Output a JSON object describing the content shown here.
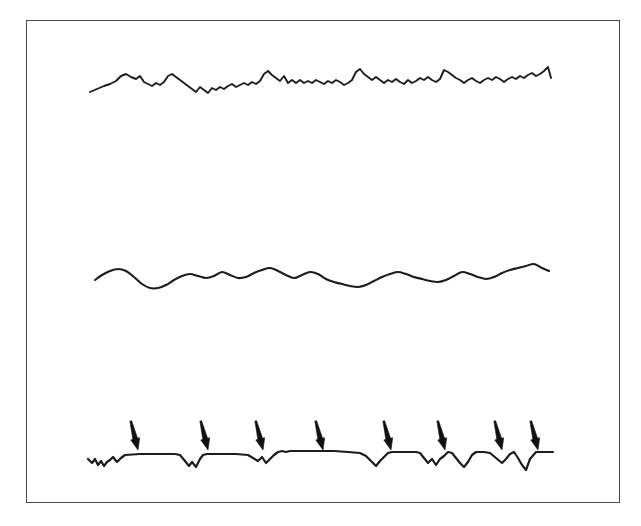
{
  "figure": {
    "title": "",
    "caption": "",
    "background_color": "#ffffff",
    "frame_color": "#4a4a4a",
    "trace_color": "#1c1c1c",
    "arrow_color": "#101010",
    "frame": {
      "x": 26,
      "y": 20,
      "width": 594,
      "height": 483
    }
  },
  "chart_data": {
    "type": "line",
    "title": "",
    "subtitle": "",
    "xlabel": "",
    "ylabel": "",
    "grid": false,
    "legend_position": "none",
    "xlim": [
      90,
      553
    ],
    "ylim": [
      20,
      503
    ],
    "series": [
      {
        "name": "top-noisy-trace",
        "style": "jagged high-frequency noise",
        "stroke_width": 1.9,
        "baseline_y": 88,
        "x": [
          90,
          97,
          104,
          110,
          116,
          121,
          126,
          131,
          136,
          140,
          144,
          148,
          152,
          156,
          160,
          164,
          168,
          172,
          176,
          180,
          184,
          188,
          192,
          196,
          200,
          204,
          208,
          212,
          216,
          220,
          224,
          228,
          232,
          236,
          240,
          244,
          248,
          252,
          256,
          260,
          264,
          268,
          272,
          276,
          280,
          284,
          288,
          292,
          296,
          300,
          304,
          308,
          312,
          316,
          320,
          324,
          328,
          332,
          336,
          340,
          344,
          348,
          352,
          356,
          360,
          364,
          368,
          372,
          376,
          380,
          384,
          388,
          392,
          396,
          400,
          404,
          408,
          412,
          416,
          420,
          424,
          428,
          432,
          436,
          440,
          444,
          448,
          452,
          456,
          460,
          464,
          468,
          472,
          476,
          480,
          484,
          488,
          492,
          496,
          500,
          504,
          508,
          512,
          516,
          520,
          524,
          528,
          532,
          536,
          540,
          544,
          548,
          551
        ],
        "y": [
          92,
          89,
          86,
          84,
          81,
          76,
          74,
          77,
          79,
          76,
          82,
          84,
          86,
          83,
          85,
          82,
          76,
          74,
          77,
          80,
          83,
          86,
          89,
          92,
          87,
          90,
          93,
          88,
          90,
          87,
          89,
          86,
          84,
          87,
          85,
          83,
          85,
          82,
          84,
          81,
          74,
          71,
          75,
          78,
          81,
          76,
          83,
          80,
          83,
          80,
          83,
          81,
          83,
          80,
          82,
          84,
          81,
          83,
          80,
          82,
          85,
          83,
          80,
          72,
          69,
          74,
          77,
          80,
          77,
          80,
          83,
          80,
          82,
          79,
          82,
          84,
          80,
          83,
          81,
          78,
          80,
          77,
          80,
          82,
          79,
          70,
          72,
          75,
          78,
          80,
          83,
          80,
          78,
          81,
          83,
          80,
          78,
          80,
          77,
          79,
          82,
          79,
          77,
          79,
          76,
          78,
          75,
          73,
          76,
          74,
          71,
          67,
          78
        ]
      },
      {
        "name": "middle-smooth-trace",
        "style": "smooth low-frequency wave",
        "stroke_width": 2.1,
        "baseline_y": 280,
        "x": [
          95,
          102,
          110,
          118,
          126,
          134,
          142,
          150,
          158,
          166,
          174,
          182,
          190,
          198,
          206,
          214,
          222,
          230,
          238,
          246,
          254,
          262,
          270,
          278,
          286,
          294,
          302,
          310,
          318,
          326,
          334,
          342,
          350,
          358,
          366,
          374,
          382,
          390,
          398,
          406,
          414,
          422,
          430,
          438,
          446,
          454,
          462,
          470,
          478,
          486,
          494,
          502,
          510,
          518,
          526,
          534,
          542,
          549
        ],
        "y": [
          280,
          275,
          271,
          269,
          271,
          277,
          284,
          288,
          288,
          285,
          280,
          276,
          274,
          276,
          278,
          276,
          272,
          275,
          278,
          277,
          273,
          270,
          268,
          271,
          275,
          278,
          275,
          272,
          274,
          279,
          282,
          284,
          286,
          287,
          285,
          281,
          277,
          274,
          272,
          274,
          277,
          279,
          281,
          282,
          280,
          276,
          272,
          274,
          277,
          279,
          277,
          273,
          270,
          268,
          266,
          264,
          268,
          271
        ]
      },
      {
        "name": "bottom-step-trace",
        "style": "step-like trace with downward deflections",
        "stroke_width": 2.2,
        "baseline_y": 458,
        "x": [
          88,
          92,
          95,
          98,
          101,
          104,
          107,
          110,
          113,
          117,
          121,
          125,
          140,
          160,
          175,
          180,
          185,
          189,
          192,
          196,
          200,
          203,
          207,
          212,
          218,
          226,
          236,
          248,
          258,
          262,
          266,
          270,
          274,
          278,
          282,
          286,
          290,
          294,
          298,
          302,
          308,
          320,
          334,
          348,
          360,
          366,
          372,
          376,
          380,
          384,
          388,
          392,
          396,
          400,
          404,
          408,
          412,
          416,
          420,
          424,
          428,
          432,
          436,
          440,
          444,
          448,
          452,
          456,
          460,
          464,
          468,
          472,
          476,
          480,
          484,
          490,
          496,
          502,
          506,
          510,
          514,
          518,
          522,
          526,
          530,
          536,
          542,
          548,
          553
        ],
        "y": [
          459,
          463,
          459,
          465,
          461,
          466,
          462,
          460,
          457,
          462,
          458,
          455,
          454,
          454,
          454,
          455,
          461,
          466,
          462,
          467,
          459,
          455,
          454,
          454,
          454,
          454,
          454,
          455,
          461,
          457,
          463,
          459,
          455,
          452,
          451,
          452,
          451,
          451,
          451,
          451,
          451,
          451,
          451,
          452,
          453,
          456,
          462,
          466,
          461,
          457,
          453,
          452,
          452,
          452,
          452,
          452,
          452,
          452,
          453,
          458,
          463,
          459,
          465,
          459,
          456,
          452,
          453,
          458,
          463,
          467,
          462,
          455,
          452,
          452,
          452,
          453,
          458,
          463,
          459,
          454,
          452,
          458,
          465,
          470,
          459,
          452,
          452,
          452,
          452
        ]
      }
    ],
    "annotations": {
      "name": "event-marker-arrows",
      "count": 8,
      "direction": "down",
      "tilt_degrees": 14,
      "length": 30,
      "tip_y": 450,
      "tip_x": [
        138,
        208,
        263,
        323,
        391,
        445,
        502,
        538
      ]
    }
  }
}
